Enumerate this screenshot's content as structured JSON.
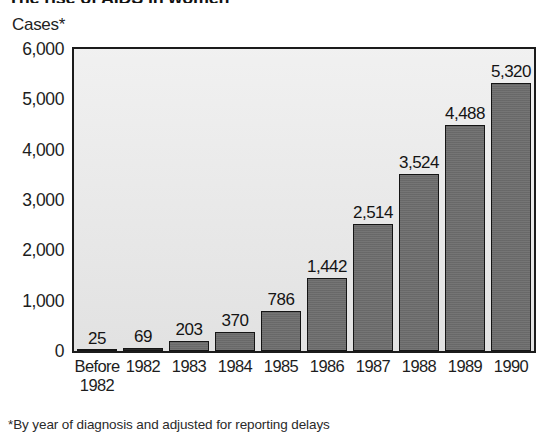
{
  "title": "The rise of AIDS in women",
  "unit_caption": "Cases*",
  "footnote": "*By year of diagnosis and adjusted for reporting delays",
  "colors": {
    "bar_fill": "#6e6e6e",
    "bar_outline": "#151515",
    "plot_background": "#e9e9e9",
    "frame": "#1b1b1b",
    "text": "#1a1a1a",
    "page_background": "#ffffff"
  },
  "chart_data": {
    "type": "bar",
    "title": "The rise of AIDS in women",
    "xlabel": "",
    "ylabel": "Cases*",
    "ylim": [
      0,
      6000
    ],
    "ytick_labels": [
      "6,000",
      "5,000",
      "4,000",
      "3,000",
      "2,000",
      "1,000",
      "0"
    ],
    "ytick_values": [
      6000,
      5000,
      4000,
      3000,
      2000,
      1000,
      0
    ],
    "grid": false,
    "legend": "none",
    "categories": [
      "Before 1982",
      "1982",
      "1983",
      "1984",
      "1985",
      "1986",
      "1987",
      "1988",
      "1989",
      "1990"
    ],
    "category_lines": [
      [
        "Before",
        "1982"
      ],
      [
        "1982",
        ""
      ],
      [
        "1983",
        ""
      ],
      [
        "1984",
        ""
      ],
      [
        "1985",
        ""
      ],
      [
        "1986",
        ""
      ],
      [
        "1987",
        ""
      ],
      [
        "1988",
        ""
      ],
      [
        "1989",
        ""
      ],
      [
        "1990",
        ""
      ]
    ],
    "values": [
      25,
      69,
      203,
      370,
      786,
      1442,
      2514,
      3524,
      4488,
      5320
    ],
    "value_labels": [
      "25",
      "69",
      "203",
      "370",
      "786",
      "1,442",
      "2,514",
      "3,524",
      "4,488",
      "5,320"
    ],
    "annotation": "*By year of diagnosis and adjusted for reporting delays"
  }
}
